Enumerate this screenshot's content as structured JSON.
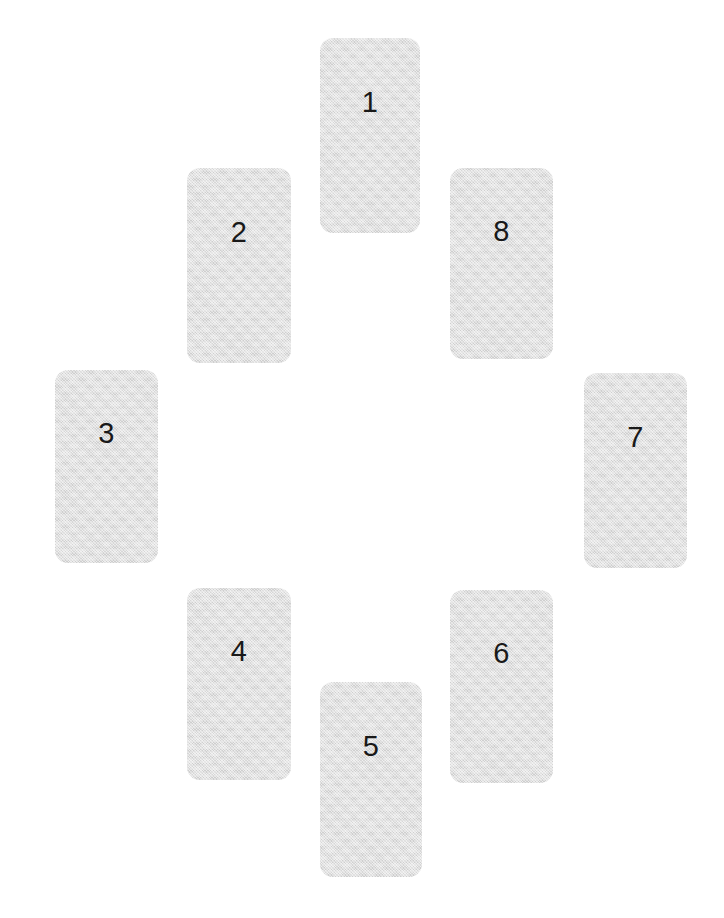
{
  "canvas": {
    "width": 724,
    "height": 918,
    "background_color": "#ffffff"
  },
  "style": {
    "card_fill_color": "#dadada",
    "card_label_color": "#191919",
    "card_corner_radius": 13,
    "card_label_font_size": 29
  },
  "layout": {
    "description": "eight numbered rectangular cards arranged in an oval ring",
    "card_count": 8,
    "arrangement": "ring"
  },
  "cards": [
    {
      "label": "1",
      "position": "top-center",
      "x": 320,
      "y": 38,
      "width": 100,
      "height": 195,
      "label_offset_pct": 33
    },
    {
      "label": "2",
      "position": "upper-left",
      "x": 187,
      "y": 168,
      "width": 104,
      "height": 195,
      "label_offset_pct": 33
    },
    {
      "label": "3",
      "position": "left",
      "x": 55,
      "y": 370,
      "width": 103,
      "height": 193,
      "label_offset_pct": 33
    },
    {
      "label": "4",
      "position": "lower-left",
      "x": 187,
      "y": 588,
      "width": 104,
      "height": 192,
      "label_offset_pct": 33
    },
    {
      "label": "5",
      "position": "bottom-center",
      "x": 320,
      "y": 682,
      "width": 102,
      "height": 195,
      "label_offset_pct": 33
    },
    {
      "label": "6",
      "position": "lower-right",
      "x": 450,
      "y": 590,
      "width": 103,
      "height": 193,
      "label_offset_pct": 33
    },
    {
      "label": "7",
      "position": "right",
      "x": 584,
      "y": 373,
      "width": 103,
      "height": 195,
      "label_offset_pct": 33
    },
    {
      "label": "8",
      "position": "upper-right",
      "x": 450,
      "y": 168,
      "width": 103,
      "height": 191,
      "label_offset_pct": 33
    }
  ]
}
